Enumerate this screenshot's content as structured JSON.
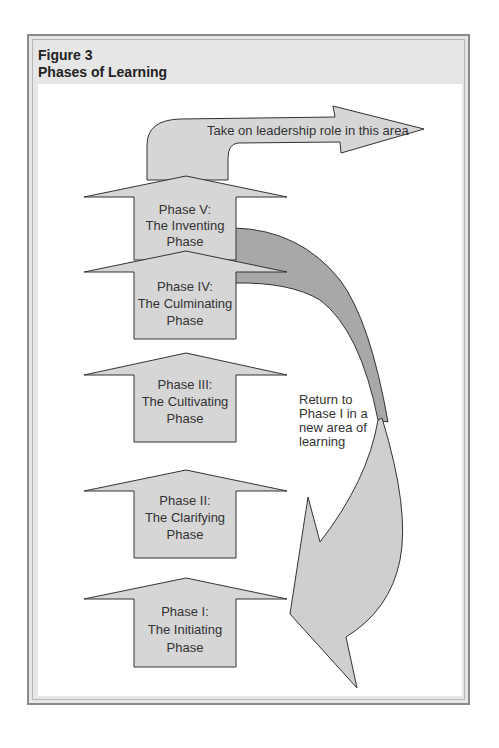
{
  "figure": {
    "number": "Figure 3",
    "title": "Phases of Learning"
  },
  "colors": {
    "arrow_fill": "#d6d6d6",
    "curve_dark": "#a8a8a8",
    "curve_light": "#cfcfcf",
    "stroke": "#333333",
    "frame_bg": "#e6e6e6"
  },
  "phases": [
    {
      "line1": "Phase I:",
      "line2": "The Initiating",
      "line3": "Phase"
    },
    {
      "line1": "Phase II:",
      "line2": "The Clarifying",
      "line3": "Phase"
    },
    {
      "line1": "Phase III:",
      "line2": "The Cultivating",
      "line3": "Phase"
    },
    {
      "line1": "Phase IV:",
      "line2": "The Culminating",
      "line3": "Phase"
    },
    {
      "line1": "Phase V:",
      "line2": "The Inventing",
      "line3": "Phase"
    }
  ],
  "leadership_arrow": {
    "label": "Take on leadership role in this area"
  },
  "return_arrow": {
    "line1": "Return to",
    "line2": "Phase I in a",
    "line3": "new area of",
    "line4": "learning"
  }
}
